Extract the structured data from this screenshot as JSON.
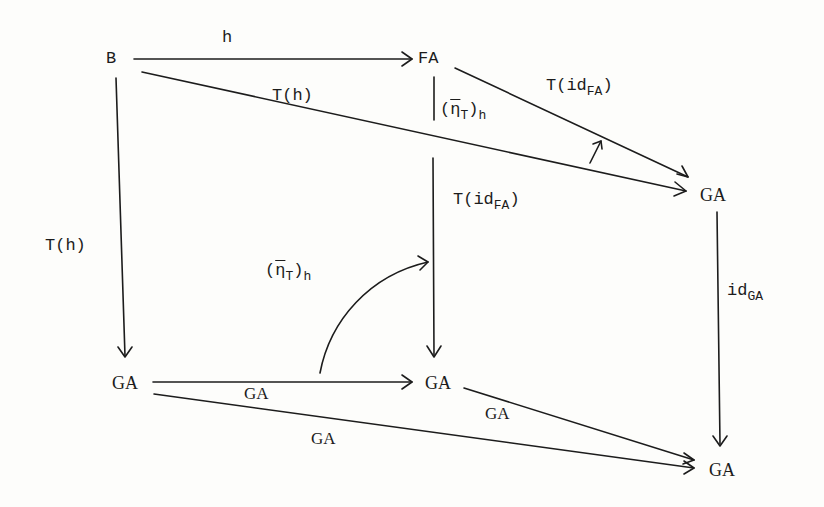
{
  "diagram": {
    "type": "commutative-diagram",
    "nodes": {
      "B": {
        "label": "B"
      },
      "FA": {
        "label": "FA"
      },
      "GA_top_right": {
        "label": "GA"
      },
      "GA_bottom_left": {
        "label": "GA"
      },
      "GA_bottom_mid": {
        "label": "GA"
      },
      "GA_bottom_right": {
        "label": "GA"
      }
    },
    "edges": {
      "h": {
        "from": "B",
        "to": "FA",
        "label": "h"
      },
      "T_h_diag": {
        "from": "B",
        "to": "GA_top_right",
        "label": "T(h)"
      },
      "T_id_FA_diag": {
        "from": "FA",
        "to": "GA_top_right",
        "label_main": "T(id",
        "label_sub": "FA",
        "label_close": ")"
      },
      "eta_T_h_top": {
        "from": "FA",
        "to": "GA_bottom_mid",
        "label_open": "(",
        "label_eta": "η",
        "label_sub_T": "T",
        "label_close": ")",
        "label_sub_h": "h"
      },
      "T_id_FA_vert": {
        "label_main": "T(id",
        "label_sub": "FA",
        "label_close": ")"
      },
      "T_h_left": {
        "from": "B",
        "to": "GA_bottom_left",
        "label": "T(h)"
      },
      "id_GA": {
        "from": "GA_top_right",
        "to": "GA_bottom_right",
        "label_main": "id",
        "label_sub": "GA"
      },
      "GA_horizontal": {
        "from": "GA_bottom_left",
        "to": "GA_bottom_mid",
        "label": "GA"
      },
      "GA_mid_to_right": {
        "from": "GA_bottom_mid",
        "to": "GA_bottom_right",
        "label": "GA"
      },
      "GA_left_to_right": {
        "from": "GA_bottom_left",
        "to": "GA_bottom_right",
        "label": "GA"
      },
      "eta_T_h_curved": {
        "label_open": "(",
        "label_eta": "η",
        "label_sub_T": "T",
        "label_close": ")",
        "label_sub_h": "h"
      },
      "two_cell_arrow": {
        "glyph": "↗"
      }
    }
  }
}
